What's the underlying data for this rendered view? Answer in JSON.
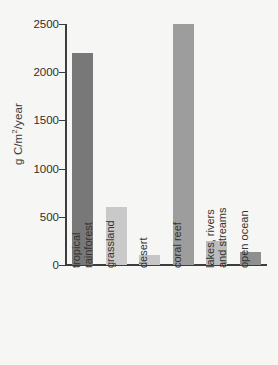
{
  "chart_data": {
    "type": "bar",
    "title": "",
    "xlabel": "",
    "ylabel": "g C/m2/year",
    "ylabel_display": "g C/m²/year",
    "categories": [
      "tropical rainforest",
      "grassland",
      "desert",
      "coral reef",
      "lakes, rivers and streams",
      "open ocean"
    ],
    "category_lines": [
      [
        "tropical",
        "rainforest"
      ],
      [
        "grassland"
      ],
      [
        "desert"
      ],
      [
        "coral reef"
      ],
      [
        "lakes, rivers",
        "and streams"
      ],
      [
        "open ocean"
      ]
    ],
    "values": [
      2200,
      600,
      100,
      2500,
      250,
      130
    ],
    "ylim": [
      0,
      2500
    ],
    "yticks": [
      0,
      500,
      1000,
      1500,
      2000,
      2500
    ],
    "ytick_labels": [
      "0",
      "500",
      "1000",
      "1500",
      "2000",
      "2500"
    ],
    "grid": false,
    "legend": "none",
    "bar_colors": [
      "#787878",
      "#c9c9c9",
      "#c6c6c6",
      "#9d9d9d",
      "#bcbcbc",
      "#8f8f8f"
    ],
    "background_color": "#f6f6f4",
    "axis_color": "#3d3d3d"
  }
}
